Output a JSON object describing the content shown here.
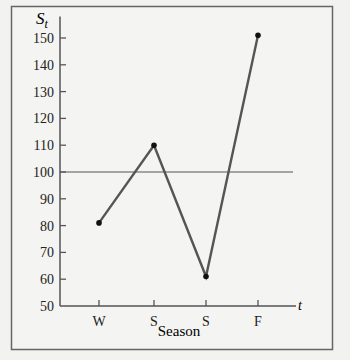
{
  "chart_data": {
    "type": "line",
    "title": "",
    "ylabel": "S",
    "ylabel_subscript": "t",
    "xlabel": "Season",
    "xaxis_end_label": "t",
    "categories": [
      "W",
      "S",
      "S",
      "F"
    ],
    "values": [
      81,
      110,
      61,
      151
    ],
    "yticks": [
      50,
      60,
      70,
      80,
      90,
      100,
      110,
      120,
      130,
      140,
      150
    ],
    "ylim": [
      50,
      155
    ],
    "reference_line": 100,
    "grid": false,
    "colors": {
      "line": "#555555",
      "point": "#111111",
      "axis": "#555555",
      "frame": "#666666"
    }
  }
}
